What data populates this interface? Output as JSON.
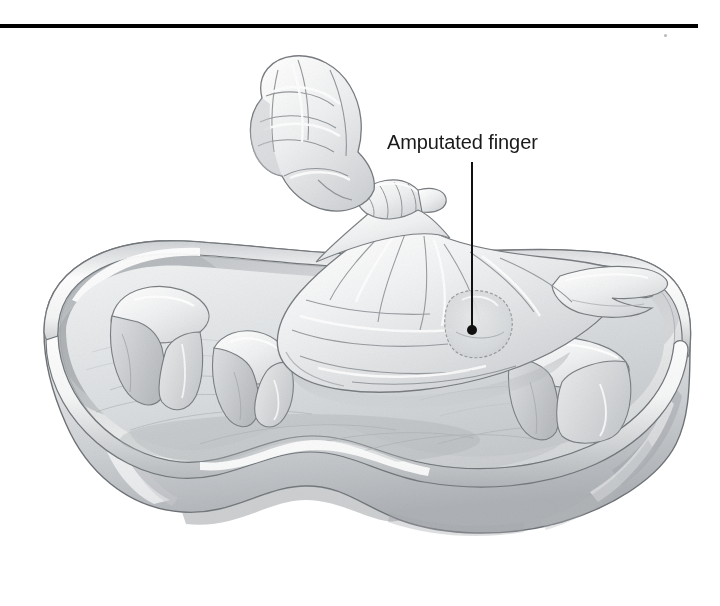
{
  "figure": {
    "kind": "medical-illustration",
    "medium": "graphite pencil drawing",
    "background_color": "#ffffff",
    "ink_color": "#1a1a1a"
  },
  "rule": {
    "name": "top-divider",
    "color": "#000000",
    "x": 0,
    "y": 24,
    "width": 698,
    "height": 4
  },
  "callout": {
    "label": "Amputated finger",
    "text_color": "#1a1a1a",
    "font_size_px": 20,
    "leader": {
      "color": "#111111",
      "x": 472,
      "y_start": 162,
      "y_end": 330,
      "dot_radius": 5
    }
  },
  "objects": [
    {
      "name": "emesis-basin",
      "label": "Kidney-shaped emesis basin"
    },
    {
      "name": "basin-rim",
      "label": "Rolled basin rim"
    },
    {
      "name": "plastic-bag",
      "label": "Sealed plastic bag"
    },
    {
      "name": "bag-twist-tie",
      "label": "Twisted and tied bag neck"
    },
    {
      "name": "amputated-finger",
      "label": "Amputated finger inside bag"
    },
    {
      "name": "ice-cube-1",
      "label": "Ice cube"
    },
    {
      "name": "ice-cube-2",
      "label": "Ice cube"
    },
    {
      "name": "ice-cube-3",
      "label": "Ice cube"
    },
    {
      "name": "ice-bed",
      "label": "Bed of crushed ice"
    }
  ],
  "palette": {
    "outline": "#6f7377",
    "outline_dark": "#4a4e52",
    "shade_light": "#f2f3f4",
    "shade_mid": "#d8dadc",
    "shade_deep": "#b6b9bc",
    "shade_deepest": "#9a9ea2",
    "highlight": "#ffffff"
  }
}
